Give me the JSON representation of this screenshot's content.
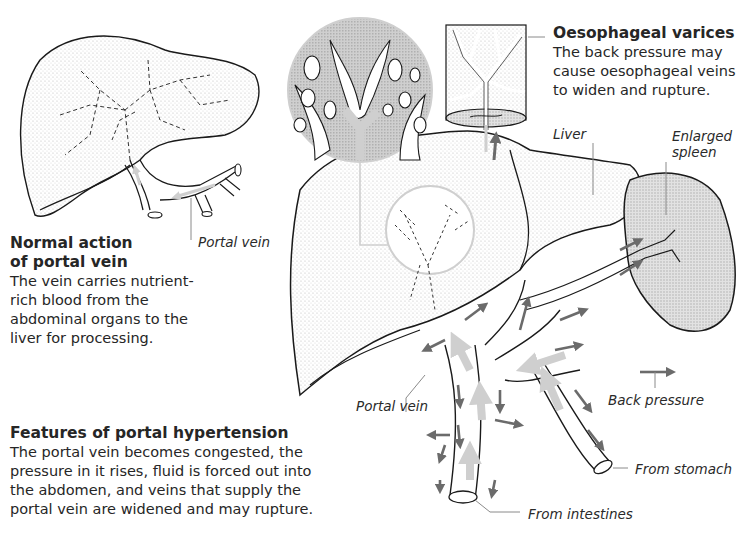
{
  "diagram": {
    "type": "anatomical-illustration",
    "subject": "Portal hypertension",
    "colors": {
      "outline": "#1a1a1a",
      "stipple": "#c9c9c9",
      "back_pressure_arrow": "#6b6b6b",
      "normal_flow_arrow": "#cfcfcf",
      "leader_line": "#8a8a8a",
      "text": "#262626"
    }
  },
  "normal_panel": {
    "heading": "Normal action of portal vein",
    "heading_line1": "Normal action",
    "heading_line2": "of portal vein",
    "body_lines": [
      "The vein carries nutrient-",
      "rich blood from the",
      "abdominal organs to the",
      "liver for processing."
    ],
    "label_portal_vein": "Portal vein"
  },
  "hypertension_panel": {
    "heading": "Features of portal hypertension",
    "body_lines": [
      "The portal vein becomes congested, the",
      "pressure in it rises, fluid is forced out into",
      "the abdomen, and veins that supply the",
      "portal vein are widened and may rupture."
    ]
  },
  "varices_panel": {
    "heading": "Oesophageal varices",
    "body_lines": [
      "The back pressure may",
      "cause oesophageal veins",
      "to widen and rupture."
    ]
  },
  "labels": {
    "liver": "Liver",
    "enlarged_spleen_line1": "Enlarged",
    "enlarged_spleen_line2": "spleen",
    "portal_vein": "Portal vein",
    "back_pressure": "Back pressure",
    "from_stomach": "From stomach",
    "from_intestines": "From intestines"
  }
}
